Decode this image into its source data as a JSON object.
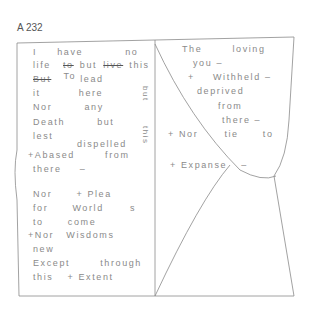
{
  "page_label": "A 232",
  "left_page": {
    "lines": [
      {
        "words": [
          "I",
          "have",
          "no"
        ]
      },
      {
        "words": [
          "life",
          "to",
          "but",
          "live",
          "this"
        ],
        "struck": [
          "to",
          "live"
        ]
      },
      {
        "words": [
          "But",
          "To",
          "lead"
        ],
        "struck": [
          "But"
        ]
      },
      {
        "words": [
          "it",
          "here"
        ]
      },
      {
        "words": [
          "Nor",
          "any"
        ]
      },
      {
        "words": [
          "Death",
          "but"
        ]
      },
      {
        "words": [
          "lest"
        ]
      },
      {
        "words": [
          "dispelled"
        ]
      },
      {
        "words": [
          "+Abased",
          "from"
        ]
      },
      {
        "words": [
          "there",
          "–"
        ]
      },
      {
        "words": [
          "Nor",
          "+ Plea"
        ]
      },
      {
        "words": [
          "for",
          "World",
          "s"
        ]
      },
      {
        "words": [
          "to",
          "come"
        ]
      },
      {
        "words": [
          "+Nor",
          "Wisdoms"
        ]
      },
      {
        "words": [
          "new"
        ]
      },
      {
        "words": [
          "Except",
          "through"
        ]
      },
      {
        "words": [
          "this",
          "+ Extent"
        ]
      }
    ],
    "margin_vertical": [
      "but",
      "this"
    ]
  },
  "right_page": {
    "lines": [
      {
        "words": [
          "The",
          "loving"
        ]
      },
      {
        "words": [
          "you –"
        ]
      },
      {
        "words": [
          "+",
          "Withheld –"
        ]
      },
      {
        "words": [
          "deprived"
        ]
      },
      {
        "words": [
          "from"
        ]
      },
      {
        "words": [
          "there –"
        ]
      },
      {
        "words": [
          "+ Nor",
          "tie",
          "to"
        ]
      },
      {
        "words": [
          "+ Expanse",
          "–"
        ]
      }
    ]
  }
}
